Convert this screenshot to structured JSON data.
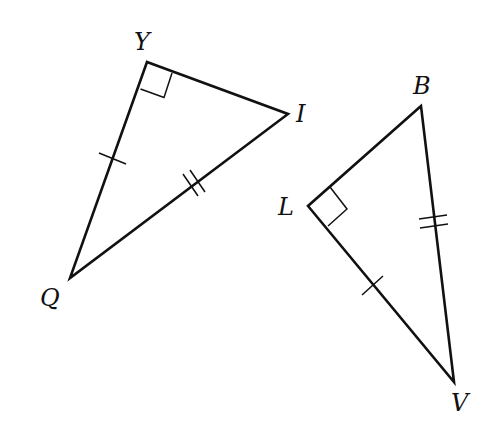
{
  "diagram": {
    "type": "geometry-figure",
    "colors": {
      "stroke": "#111111",
      "background": "#ffffff"
    },
    "triangles": [
      {
        "name": "YQI",
        "vertices": [
          {
            "label": "Y",
            "x": 147,
            "y": 62
          },
          {
            "label": "I",
            "x": 288,
            "y": 114
          },
          {
            "label": "Q",
            "x": 70,
            "y": 278
          }
        ],
        "right_angle_at": "Y",
        "tick_marks": [
          {
            "segment": "YQ",
            "count": 1
          },
          {
            "segment": "QI",
            "count": 2
          }
        ]
      },
      {
        "name": "LBV",
        "vertices": [
          {
            "label": "B",
            "x": 421,
            "y": 106
          },
          {
            "label": "L",
            "x": 308,
            "y": 206
          },
          {
            "label": "V",
            "x": 454,
            "y": 382
          }
        ],
        "right_angle_at": "L",
        "tick_marks": [
          {
            "segment": "LV",
            "count": 1
          },
          {
            "segment": "BV",
            "count": 2
          }
        ]
      }
    ],
    "labels": {
      "Y": "Y",
      "I": "I",
      "Q": "Q",
      "B": "B",
      "L": "L",
      "V": "V"
    }
  }
}
